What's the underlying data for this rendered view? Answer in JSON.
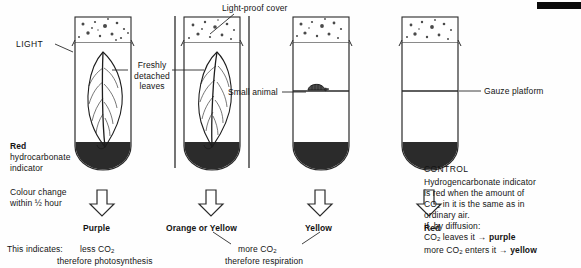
{
  "diagram": {
    "title_hidden": "Hydrogencarbonate indicator experiment",
    "left_labels": {
      "light": "LIGHT",
      "indicator_bold": "Red",
      "indicator_rest": "hydrocarbonate\nindicator",
      "colour_change": "Colour change\nwithin ½ hour",
      "this_indicates": "This indicates:"
    },
    "callouts": {
      "light_proof_cover": "Light-proof cover",
      "freshly_detached_leaves": "Freshly\ndetached\nleaves",
      "small_animal": "Small animal",
      "gauze_platform": "Gauze platform"
    },
    "tubes": [
      {
        "id": "tube-1",
        "result": "Purple",
        "contents": "leaf",
        "cover": false,
        "platform": false,
        "animal": false
      },
      {
        "id": "tube-2",
        "result": "Orange or Yellow",
        "contents": "leaf",
        "cover": true,
        "platform": false,
        "animal": false
      },
      {
        "id": "tube-3",
        "result": "Yellow",
        "contents": "animal",
        "cover": false,
        "platform": true,
        "animal": true
      },
      {
        "id": "tube-4",
        "result": "Red",
        "contents": "empty",
        "cover": false,
        "platform": true,
        "animal": false
      }
    ],
    "conclusions": {
      "less_co2": "less CO",
      "less_co2_sub": "2",
      "therefore_photosynthesis": "therefore photosynthesis",
      "more_co2": "more CO",
      "more_co2_sub": "2",
      "therefore_respiration": "therefore respiration"
    },
    "control": {
      "heading": "CONTROL",
      "line1": "Hydrogencarbonate indicator",
      "line2": "is red when the amount of",
      "line3_a": "CO",
      "line3_sub": "2",
      "line3_b": " in it is the same as in",
      "line4": "ordinary air.",
      "line5": "If, by diffusion:",
      "line6_a": "CO",
      "line6_sub": "2",
      "line6_b": " leaves it ",
      "line6_arrow": "→",
      "line6_bold": "purple",
      "line7_a": "more CO",
      "line7_sub": "2",
      "line7_b": " enters it ",
      "line7_arrow": "→",
      "line7_bold": "yellow"
    },
    "colors": {
      "ink": "#141414",
      "liquid": "#2b2b2b",
      "line": "#2a2a2a",
      "paper": "#fefefe"
    }
  }
}
